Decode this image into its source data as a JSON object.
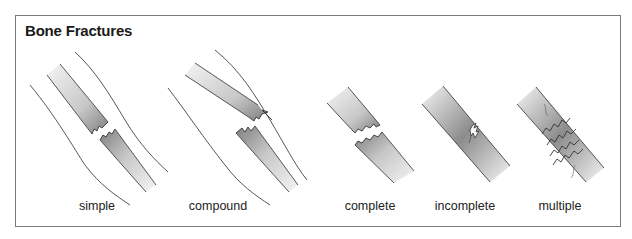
{
  "title": "Bone Fractures",
  "colors": {
    "line": "#3a3a3a",
    "bone_dark": "#8a8a8a",
    "bone_light": "#f2f2f2",
    "frame": "#7a7a7a"
  },
  "fractures": [
    {
      "label": "simple",
      "description": "bone broken cleanly, skin intact"
    },
    {
      "label": "compound",
      "description": "broken bone ends pierce through skin"
    },
    {
      "label": "complete",
      "description": "bone broken fully across"
    },
    {
      "label": "incomplete",
      "description": "partial crack in bone"
    },
    {
      "label": "multiple",
      "description": "bone broken in several places"
    }
  ]
}
